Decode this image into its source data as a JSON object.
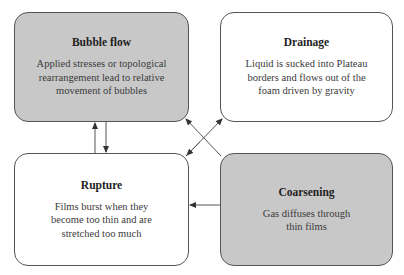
{
  "diagram": {
    "nodes": [
      {
        "id": "bubble-flow",
        "title": "Bubble flow",
        "description": "Applied stresses or topological rearrangement lead to relative movement of bubbles",
        "fill": "#c8c8c8"
      },
      {
        "id": "drainage",
        "title": "Drainage",
        "description": "Liquid is sucked into Plateau borders and flows out of the foam driven by gravity",
        "fill": "#ffffff"
      },
      {
        "id": "rupture",
        "title": "Rupture",
        "description": "Films burst when they become too thin and are stretched too much",
        "fill": "#ffffff"
      },
      {
        "id": "coarsening",
        "title": "Coarsening",
        "description": "Gas diffuses through thin films",
        "fill": "#c8c8c8"
      }
    ],
    "edges": [
      {
        "from": "rupture",
        "to": "bubble-flow"
      },
      {
        "from": "bubble-flow",
        "to": "rupture"
      },
      {
        "from": "coarsening",
        "to": "bubble-flow"
      },
      {
        "from": "rupture",
        "to": "drainage"
      },
      {
        "from": "coarsening",
        "to": "rupture"
      }
    ],
    "colors": {
      "gray_fill": "#c8c8c8",
      "border": "#555555",
      "arrow": "#444444"
    }
  }
}
